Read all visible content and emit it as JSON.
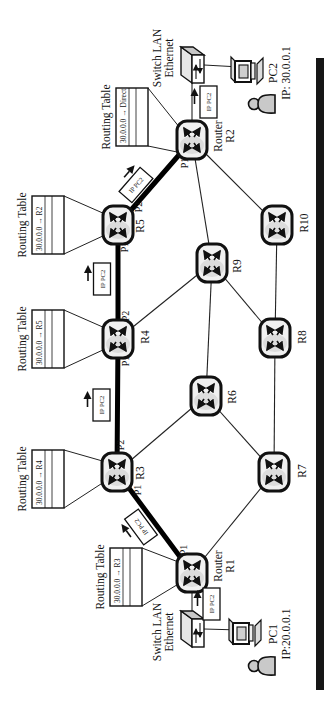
{
  "tables": {
    "r1": {
      "title": "Routing Table",
      "entry": "30.0.0.0 → R3"
    },
    "r3": {
      "title": "Routing Table",
      "entry": "30.0.0.0 → R4"
    },
    "r4": {
      "title": "Routing Table",
      "entry": "30.0.0.0 → R5"
    },
    "r5": {
      "title": "Routing Table",
      "entry": "30.0.0.0 → R2"
    },
    "r2": {
      "title": "Routing Table",
      "entry": "30.0.0.0 → Direct"
    }
  },
  "routers": {
    "r1": {
      "name_line1": "Router",
      "name_line2": "R1",
      "p1": "P1"
    },
    "r2": {
      "name_line1": "Router",
      "name_line2": "R2",
      "p1": "P1"
    },
    "r3": {
      "name": "R3",
      "p1": "P1",
      "p2": "P2"
    },
    "r4": {
      "name": "R4",
      "p1": "P1",
      "p2": "P2"
    },
    "r5": {
      "name": "R5",
      "p1": "P1",
      "p2": "P2"
    },
    "r6": {
      "name": "R6"
    },
    "r7": {
      "name": "R7"
    },
    "r8": {
      "name": "R8"
    },
    "r9": {
      "name": "R9"
    },
    "r10": {
      "name": "R10"
    }
  },
  "packet": {
    "label": "IP PC2"
  },
  "hosts": {
    "pc1": {
      "name": "PC1",
      "ip": "IP:20.0.0.1"
    },
    "pc2": {
      "name": "PC2",
      "ip": "IP: 30.0.0.1"
    }
  },
  "switches": {
    "left": {
      "line1": "Switch LAN",
      "line2": "Ethernet"
    },
    "right": {
      "line1": "Switch LAN",
      "line2": "Ethernet"
    }
  }
}
